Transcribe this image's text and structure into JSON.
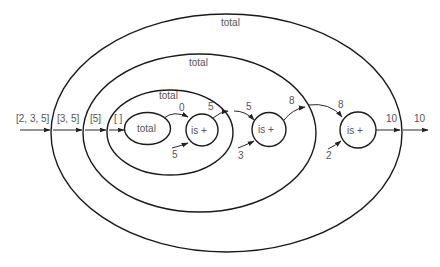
{
  "diagram": {
    "type": "recursive call trace",
    "ellipses": {
      "outer": {
        "label": "total"
      },
      "middle": {
        "label": "total"
      },
      "inner": {
        "label": "total"
      },
      "base": {
        "label": "total"
      }
    },
    "nodes": {
      "add1": {
        "label": "is +"
      },
      "add2": {
        "label": "is +"
      },
      "add3": {
        "label": "is +"
      }
    },
    "inputs": {
      "list0": "[2, 3, 5]",
      "list1": "[3, 5]",
      "list2": "[5]",
      "list3": "[ ]"
    },
    "edges": {
      "base_result": "0",
      "head1": "5",
      "sum1_out": "5",
      "sum1_in": "5",
      "head2": "3",
      "sum2_out": "8",
      "sum2_in": "8",
      "head3": "2",
      "sum3_out": "10",
      "final_out": "10"
    }
  }
}
